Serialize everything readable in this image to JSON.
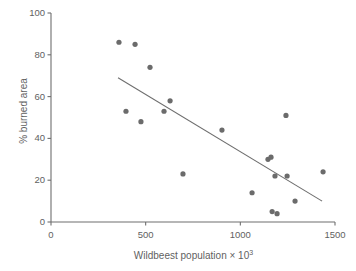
{
  "chart_data": {
    "type": "scatter",
    "title": "",
    "xlabel": "Wildbeest population × 10³",
    "xlabel_base": "Wildbeest population × 10",
    "xlabel_exponent": "3",
    "ylabel": "% burned area",
    "xlim": [
      0,
      1500
    ],
    "ylim": [
      0,
      100
    ],
    "xticks": [
      0,
      500,
      1000,
      1500
    ],
    "xtick_labels": [
      "0",
      "500",
      "1000",
      "1500"
    ],
    "yticks": [
      0,
      20,
      40,
      60,
      80,
      100
    ],
    "ytick_labels": [
      "0",
      "20",
      "40",
      "60",
      "80",
      "100"
    ],
    "grid": false,
    "legend": null,
    "marker": {
      "shape": "circle",
      "color": "#6b6b6b",
      "radius_px": 2.6
    },
    "points": [
      {
        "x": 359,
        "y": 86
      },
      {
        "x": 444,
        "y": 85
      },
      {
        "x": 523,
        "y": 74
      },
      {
        "x": 396,
        "y": 53
      },
      {
        "x": 475,
        "y": 48
      },
      {
        "x": 597,
        "y": 53
      },
      {
        "x": 629,
        "y": 58
      },
      {
        "x": 697,
        "y": 23
      },
      {
        "x": 903,
        "y": 44
      },
      {
        "x": 1062,
        "y": 14
      },
      {
        "x": 1146,
        "y": 30
      },
      {
        "x": 1162,
        "y": 31
      },
      {
        "x": 1183,
        "y": 22
      },
      {
        "x": 1168,
        "y": 5
      },
      {
        "x": 1194,
        "y": 4
      },
      {
        "x": 1241,
        "y": 51
      },
      {
        "x": 1247,
        "y": 22
      },
      {
        "x": 1289,
        "y": 10
      },
      {
        "x": 1437,
        "y": 24
      }
    ],
    "trend_line": {
      "type": "linear-fit",
      "color": "#6e6e6e",
      "x_start": 354,
      "y_start": 69,
      "x_end": 1432,
      "y_end": 10
    }
  },
  "axes": {
    "y_title": "% burned area",
    "x_title_base": "Wildbeest population × 10",
    "x_title_exponent": "3"
  }
}
